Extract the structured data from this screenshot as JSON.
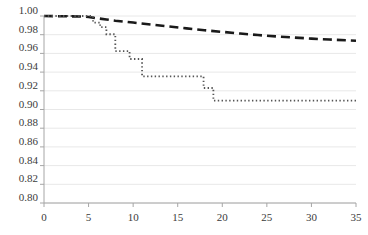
{
  "chart_data": {
    "type": "line",
    "title": "",
    "subtitle": "",
    "xlabel": "",
    "ylabel": "",
    "xlim": [
      0,
      35
    ],
    "ylim": [
      0.8,
      1.0
    ],
    "x_ticks": [
      0,
      5,
      10,
      15,
      20,
      25,
      30,
      35
    ],
    "x_tick_labels": [
      "0",
      "5",
      "10",
      "15",
      "20",
      "25",
      "30",
      "35"
    ],
    "y_ticks": [
      0.8,
      0.82,
      0.84,
      0.86,
      0.88,
      0.9,
      0.92,
      0.94,
      0.96,
      0.98,
      1.0
    ],
    "y_tick_labels": [
      "0.80",
      "0.82",
      "0.84",
      "0.86",
      "0.88",
      "0.90",
      "0.92",
      "0.94",
      "0.96",
      "0.98",
      "1.00"
    ],
    "grid": true,
    "grid_axis": "y",
    "legend": false,
    "legend_position": "none",
    "axis_color": "#a6a6a6",
    "grid_color": "#e8e8e8",
    "tick_label_color": "#3b3b3b",
    "series": [
      {
        "name": "dashed-curve",
        "style": "dashed",
        "color": "#1a1a1a",
        "width": 2.6,
        "dash": "9,5",
        "step": false,
        "points": [
          [
            0.0,
            1.0
          ],
          [
            4.0,
            0.9995
          ],
          [
            5.0,
            0.999
          ],
          [
            6.0,
            0.9975
          ],
          [
            7.0,
            0.9963
          ],
          [
            8.0,
            0.995
          ],
          [
            9.0,
            0.994
          ],
          [
            10.0,
            0.993
          ],
          [
            12.0,
            0.9908
          ],
          [
            14.0,
            0.9888
          ],
          [
            16.0,
            0.9868
          ],
          [
            18.0,
            0.9848
          ],
          [
            20.0,
            0.983
          ],
          [
            22.0,
            0.9812
          ],
          [
            24.0,
            0.9796
          ],
          [
            26.0,
            0.9782
          ],
          [
            28.0,
            0.977
          ],
          [
            30.0,
            0.9758
          ],
          [
            32.0,
            0.9748
          ],
          [
            34.0,
            0.974
          ],
          [
            35.0,
            0.9736
          ]
        ]
      },
      {
        "name": "dotted-step-curve",
        "style": "dotted",
        "color": "#555555",
        "width": 1.8,
        "dash": "1.4,2.4",
        "step": true,
        "points": [
          [
            0.0,
            1.0
          ],
          [
            5.5,
            1.0
          ],
          [
            5.5,
            0.993
          ],
          [
            6.3,
            0.993
          ],
          [
            6.3,
            0.988
          ],
          [
            7.0,
            0.988
          ],
          [
            7.0,
            0.9805
          ],
          [
            8.0,
            0.9805
          ],
          [
            8.0,
            0.9625
          ],
          [
            9.6,
            0.9625
          ],
          [
            9.6,
            0.954
          ],
          [
            11.0,
            0.954
          ],
          [
            11.0,
            0.9355
          ],
          [
            17.9,
            0.9355
          ],
          [
            17.9,
            0.923
          ],
          [
            19.0,
            0.923
          ],
          [
            19.0,
            0.9095
          ],
          [
            35.0,
            0.9095
          ]
        ]
      }
    ]
  }
}
